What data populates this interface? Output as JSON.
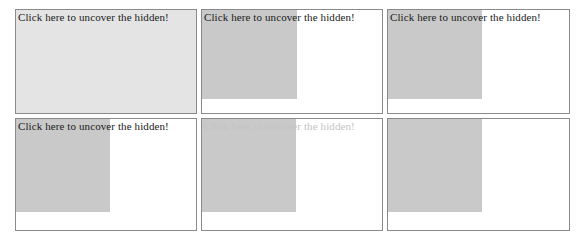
{
  "page": {
    "title": "Click here to uncover the hidden!",
    "background_color": "#ffffff",
    "border_color": "#8a8a8a",
    "cover_color": "#c9c9c9",
    "cover_color_light": "#e4e4e4",
    "text_color": "#1a1a1a",
    "text_color_faded": "#c4c4c4",
    "grid": {
      "columns": 3,
      "rows": 2,
      "total_panels": 6
    }
  },
  "panels": [
    {
      "id": "panel-1",
      "label": "Click here to uncover the hidden!",
      "label_state": "visible",
      "cover_state": "full",
      "cover_width_pct": 100,
      "cover_height_pct": 100
    },
    {
      "id": "panel-2",
      "label": "Click here to uncover the hidden!",
      "label_state": "visible",
      "cover_state": "partial",
      "cover_width_pct": 53,
      "cover_height_pct": 86
    },
    {
      "id": "panel-3",
      "label": "Click here to uncover the hidden!",
      "label_state": "visible",
      "cover_state": "partial",
      "cover_width_pct": 52,
      "cover_height_pct": 86
    },
    {
      "id": "panel-4",
      "label": "Click here to uncover the hidden!",
      "label_state": "visible",
      "cover_state": "partial",
      "cover_width_pct": 52,
      "cover_height_pct": 84
    },
    {
      "id": "panel-5",
      "label": "Click here to uncover the hidden!",
      "label_state": "faded",
      "cover_state": "partial",
      "cover_width_pct": 52,
      "cover_height_pct": 84
    },
    {
      "id": "panel-6",
      "label": "Click here to uncover the hidden!",
      "label_state": "hidden",
      "cover_state": "partial",
      "cover_width_pct": 52,
      "cover_height_pct": 84
    }
  ]
}
